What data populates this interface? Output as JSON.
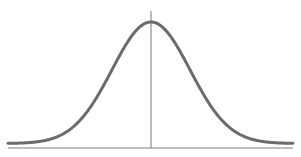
{
  "chart_data": {
    "type": "line",
    "title": "",
    "subtitle": "",
    "xlabel": "",
    "ylabel": "",
    "series": [
      {
        "name": "normal distribution",
        "distribution": "normal",
        "mean": 0,
        "std": 1,
        "x": [
          -3.5,
          -3,
          -2.5,
          -2,
          -1.5,
          -1,
          -0.5,
          0,
          0.5,
          1,
          1.5,
          2,
          2.5,
          3,
          3.5
        ],
        "values": [
          0.0009,
          0.0044,
          0.0175,
          0.054,
          0.1295,
          0.242,
          0.3521,
          0.3989,
          0.3521,
          0.242,
          0.1295,
          0.054,
          0.0175,
          0.0044,
          0.0009
        ]
      }
    ],
    "xlim": [
      -3.7,
      3.7
    ],
    "ylim": [
      0,
      0.42
    ],
    "grid": false,
    "legend": null,
    "annotations": [
      "vertical line at the mean (x = 0)"
    ]
  },
  "style": {
    "curve_color": "#6b6b6b",
    "axis_color": "#7a7a7a",
    "background": "#ffffff"
  }
}
